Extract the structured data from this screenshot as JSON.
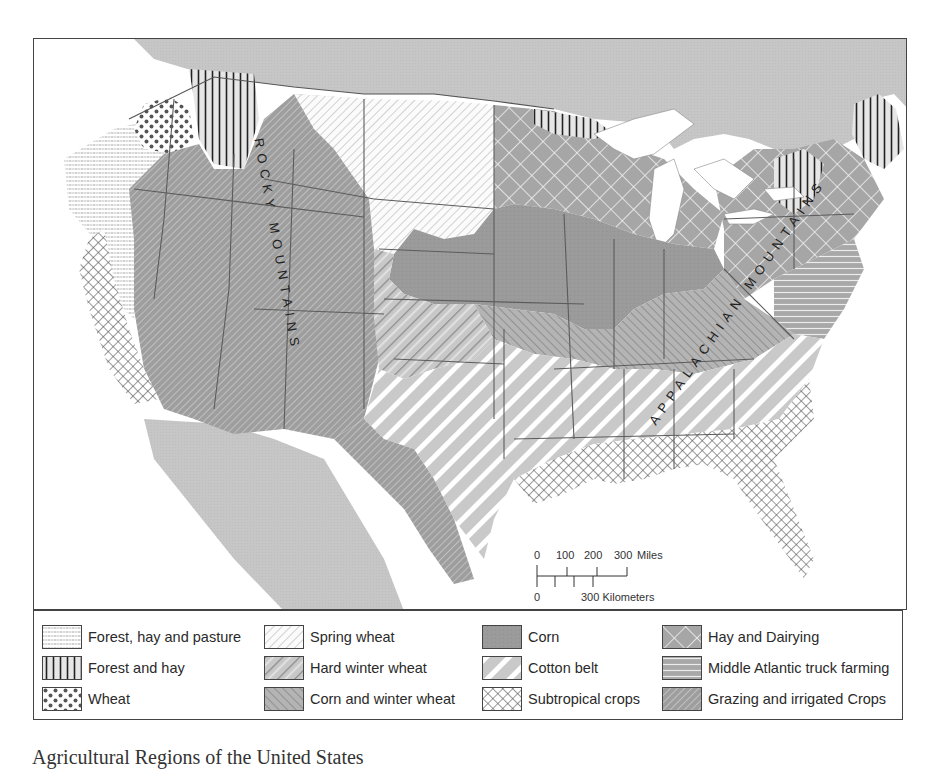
{
  "map": {
    "labels": {
      "rocky": "ROCKY MOUNTAINS",
      "appalachian": "APPALACHIAN MOUNTAINS"
    },
    "scale_bar": {
      "miles_label": "0    100  200   300 Miles",
      "km_label": "0          300 Kilometers",
      "miles_ticks": [
        "0",
        "100",
        "200",
        "300"
      ],
      "miles_unit": "Miles",
      "km_ticks": [
        "0",
        "300"
      ],
      "km_unit": "Kilometers"
    },
    "colors": {
      "land_gray": "#c4c4c4",
      "dark_fill": "#9a9a9a",
      "water": "#ffffff",
      "border": "#555555"
    }
  },
  "legend": {
    "columns": [
      [
        {
          "label": "Forest, hay and pasture",
          "pattern": "horizontal-fine-lines"
        },
        {
          "label": "Forest and hay",
          "pattern": "vertical-lines"
        },
        {
          "label": "Wheat",
          "pattern": "dots"
        }
      ],
      [
        {
          "label": "Spring wheat",
          "pattern": "diagonal-fine-white"
        },
        {
          "label": "Hard winter wheat",
          "pattern": "diagonal-gray-wide"
        },
        {
          "label": "Corn and winter wheat",
          "pattern": "diagonal-reverse-gray"
        }
      ],
      [
        {
          "label": "Corn",
          "pattern": "solid-dark-gray"
        },
        {
          "label": "Cotton belt",
          "pattern": "diagonal-white-bands"
        },
        {
          "label": "Subtropical crops",
          "pattern": "crosshatch"
        }
      ],
      [
        {
          "label": "Hay and Dairying",
          "pattern": "diamond-grid-gray"
        },
        {
          "label": "Middle Atlantic truck farming",
          "pattern": "horizontal-gray-bands"
        },
        {
          "label": "Grazing and irrigated Crops",
          "pattern": "diagonal-dense-gray"
        }
      ]
    ]
  },
  "caption": "Agricultural Regions of the United States"
}
